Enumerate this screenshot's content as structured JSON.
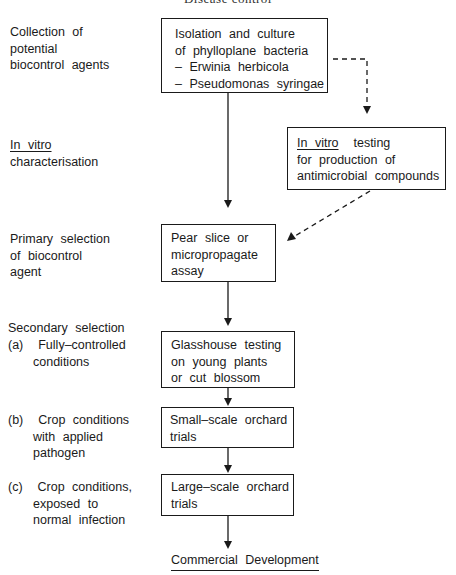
{
  "running_header": "Disease control",
  "stages": [
    {
      "label_lines": [
        "Collection  of",
        "potential",
        "biocontrol  agents"
      ]
    },
    {
      "label_lines_underlined": "In  vitro",
      "label_lines": [
        "characterisation"
      ]
    },
    {
      "label_lines": [
        "Primary  selection",
        "of  biocontrol",
        "agent"
      ]
    },
    {
      "heading": "Secondary  selection",
      "sub": [
        {
          "marker": "(a)",
          "lines": [
            "Fully–controlled",
            "conditions"
          ]
        },
        {
          "marker": "(b)",
          "lines": [
            "Crop  conditions",
            "with  applied",
            "pathogen"
          ]
        },
        {
          "marker": "(c)",
          "lines": [
            "Crop  conditions,",
            "exposed  to",
            "normal  infection"
          ]
        }
      ]
    }
  ],
  "boxes": {
    "isolation": [
      "Isolation  and  culture",
      "of  phylloplane  bacteria",
      "–  Erwinia  herbicola",
      "–  Pseudomonas  syringae"
    ],
    "in_vitro_testing": {
      "underlined": "In  vitro",
      "rest_first": "  testing",
      "lines": [
        "for  production  of",
        "antimicrobial  compounds"
      ]
    },
    "pear_slice": [
      "Pear  slice  or",
      "micropropagate",
      "assay"
    ],
    "glasshouse": [
      "Glasshouse  testing",
      "on  young  plants",
      "or  cut  blossom"
    ],
    "small_scale": [
      "Small–scale  orchard",
      "trials"
    ],
    "large_scale": [
      "Large–scale  orchard",
      "trials"
    ]
  },
  "final_outcome": "Commercial  Development"
}
